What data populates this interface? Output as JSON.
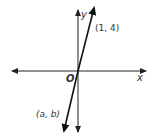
{
  "diagram": {
    "type": "coordinate-plane",
    "axes": {
      "x_label": "x",
      "y_label": "y",
      "origin_label": "O"
    },
    "line": {
      "through_origin": true,
      "points": [
        {
          "label": "(1, 4)"
        },
        {
          "label": "(a, b)"
        }
      ]
    },
    "colors": {
      "axis": "#222222",
      "line": "#111111",
      "text": "#333333"
    }
  }
}
